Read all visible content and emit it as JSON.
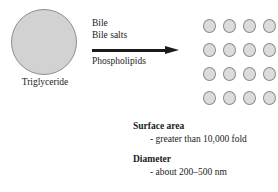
{
  "diagram": {
    "source": {
      "shape_name": "triglyceride-droplet",
      "label": "Triglyceride"
    },
    "reagents": {
      "above_arrow": [
        "Bile",
        "Bile salts"
      ],
      "below_arrow": "Phospholipids",
      "arrow_name": "emulsification-arrow"
    },
    "product": {
      "shape_name": "micelle",
      "rows": 4,
      "columns": 4,
      "count": 16
    },
    "caption": [
      {
        "heading": "Surface area",
        "detail": "- greater than 10,000 fold"
      },
      {
        "heading": "Diameter",
        "detail": "- about 200–500 nm"
      }
    ]
  },
  "colors": {
    "droplet_fill": "#d2d2d2",
    "droplet_stroke": "#8d8d8d",
    "micelle_fill": "#dcdcdc",
    "micelle_stroke": "#8d8d8d",
    "text": "#1b1b1b",
    "background": "#ffffff"
  }
}
